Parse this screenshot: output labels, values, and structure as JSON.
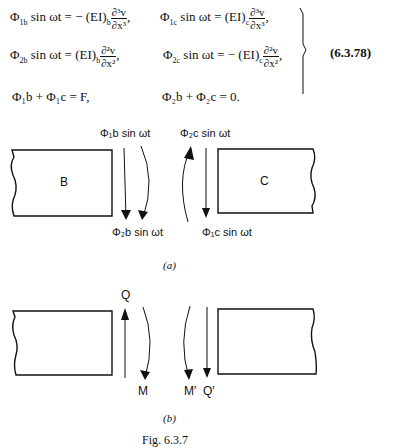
{
  "equations": {
    "row1_left": {
      "lhs": "Φ",
      "sub": "1b",
      "mid": " sin ωt = − (EI)",
      "coef_sub": "b",
      "num": "∂³v",
      "den": "∂x³",
      "tail": ","
    },
    "row1_right": {
      "lhs": "Φ",
      "sub": "1c",
      "mid": " sin ωt = (EI)",
      "coef_sub": "c",
      "num": "∂³v",
      "den": "∂x³",
      "tail": ","
    },
    "row2_left": {
      "lhs": "Φ",
      "sub": "2b",
      "mid": " sin ωt = (EI)",
      "coef_sub": "b",
      "num": "∂²v",
      "den": "∂x²",
      "tail": ","
    },
    "row2_right": {
      "lhs": "Φ",
      "sub": "2c",
      "mid": " sin ωt = − (EI)",
      "coef_sub": "c",
      "num": "∂²v",
      "den": "∂x²",
      "tail": ","
    },
    "row3_left": "Φ₁b + Φ₁c = F,",
    "row3_right": "Φ₂b + Φ₂c = 0.",
    "number": "(6.3.78)"
  },
  "figure_a": {
    "block_left_label": "B",
    "block_right_label": "C",
    "top_left_label": "Φ₁b sin ωt",
    "top_right_label": "Φ₂c sin ωt",
    "bottom_left_label": "Φ₂b sin ωt",
    "bottom_right_label": "Φ₁c sin ωt",
    "caption": "(a)"
  },
  "figure_b": {
    "top_label": "Q",
    "bottom_labels": [
      "M",
      "M′",
      "Q′"
    ],
    "caption": "(b)"
  },
  "figure_caption": "Fig. 6.3.7"
}
